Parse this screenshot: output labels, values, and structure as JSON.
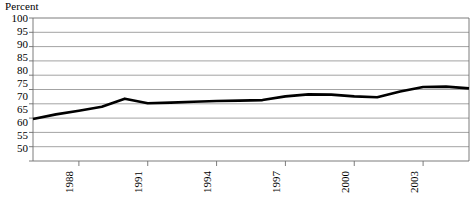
{
  "chart_data": {
    "type": "line",
    "title": "",
    "subtitle": "",
    "ylabel": "Percent",
    "xlabel": "",
    "ylim": [
      50,
      100
    ],
    "ytick_step": 5,
    "yticks": [
      100,
      95,
      90,
      85,
      80,
      75,
      70,
      65,
      60,
      55,
      50
    ],
    "ytick_labels": [
      "100",
      "95",
      "90",
      "85",
      "80",
      "75",
      "70",
      "65",
      "60",
      "55",
      "50"
    ],
    "xlim": [
      1986,
      2005
    ],
    "xticks": [
      1988,
      1991,
      1994,
      1997,
      2000,
      2003
    ],
    "xtick_labels": [
      "1988",
      "1991",
      "1994",
      "1997",
      "2000",
      "2003"
    ],
    "xtick_rotation": -90,
    "grid": "horizontal",
    "legend": "none",
    "line_color": "#000000",
    "line_width": 2.6,
    "grid_color": "#8c8c8c",
    "frame_color": "#6e6e6e",
    "x": [
      1986,
      1987,
      1988,
      1989,
      1990,
      1991,
      1992,
      1993,
      1994,
      1995,
      1996,
      1997,
      1998,
      1999,
      2000,
      2001,
      2002,
      2003,
      2004,
      2005
    ],
    "values": [
      64.7,
      66.3,
      67.6,
      69.0,
      71.8,
      70.2,
      70.4,
      70.7,
      71.0,
      71.1,
      71.3,
      72.6,
      73.3,
      73.2,
      72.6,
      72.3,
      74.3,
      75.9,
      76.0,
      75.4
    ],
    "series": [
      {
        "name": "Percent",
        "values": [
          64.7,
          66.3,
          67.6,
          69.0,
          71.8,
          70.2,
          70.4,
          70.7,
          71.0,
          71.1,
          71.3,
          72.6,
          73.3,
          73.2,
          72.6,
          72.3,
          74.3,
          75.9,
          76.0,
          75.4
        ]
      }
    ]
  },
  "labels": {
    "y_axis_title": "Percent",
    "y": {
      "t0": "100",
      "t1": "95",
      "t2": "90",
      "t3": "85",
      "t4": "80",
      "t5": "75",
      "t6": "70",
      "t7": "65",
      "t8": "60",
      "t9": "55",
      "t10": "50"
    },
    "x": {
      "t0": "1988",
      "t1": "1991",
      "t2": "1994",
      "t3": "1997",
      "t4": "2000",
      "t5": "2003"
    }
  }
}
